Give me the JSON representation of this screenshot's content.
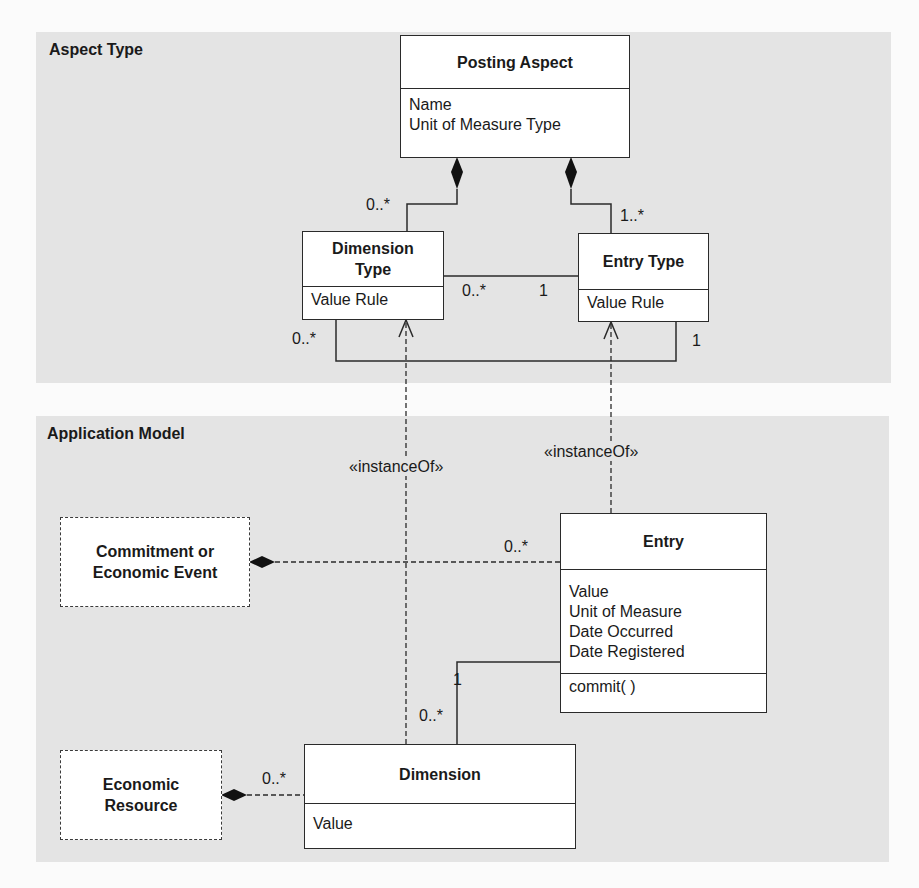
{
  "panels": {
    "aspect_type": {
      "title": "Aspect Type",
      "bg": "#e4e4e4"
    },
    "application_model": {
      "title": "Application Model",
      "bg": "#e4e4e4"
    }
  },
  "classes": {
    "posting_aspect": {
      "name": "Posting Aspect",
      "attributes": [
        "Name",
        "Unit of Measure Type"
      ]
    },
    "dimension_type": {
      "name_line1": "Dimension",
      "name_line2": "Type",
      "attributes": [
        "Value Rule"
      ]
    },
    "entry_type": {
      "name": "Entry Type",
      "attributes": [
        "Value Rule"
      ]
    },
    "entry": {
      "name": "Entry",
      "attributes": [
        "Value",
        "Unit of Measure",
        "Date Occurred",
        "Date Registered"
      ],
      "operations": [
        "commit( )"
      ]
    },
    "dimension": {
      "name": "Dimension",
      "attributes": [
        "Value"
      ]
    }
  },
  "external": {
    "commitment_event": {
      "line1": "Commitment or",
      "line2": "Economic Event"
    },
    "economic_resource": {
      "line1": "Economic",
      "line2": "Resource"
    }
  },
  "multiplicities": {
    "posting_to_dimtype": "0..*",
    "posting_to_entrytype": "1..*",
    "dimtype_entrytype_left": "0..*",
    "dimtype_entrytype_right": "1",
    "dimtype_lower_loop": "0..*",
    "entrytype_lower_loop": "1",
    "commitment_to_entry": "0..*",
    "entry_to_dimension": "1",
    "dimension_from_entry": "0..*",
    "resource_to_dimension": "0..*"
  },
  "stereotypes": {
    "dimension_instance_of": "«instanceOf»",
    "entry_instance_of": "«instanceOf»"
  }
}
